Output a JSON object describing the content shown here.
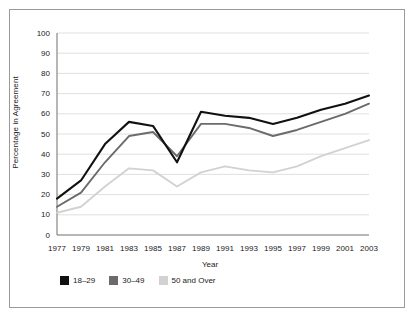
{
  "chart_data": {
    "type": "line",
    "title": "",
    "xlabel": "Year",
    "ylabel": "Percentage in Agreement",
    "x": [
      1977,
      1979,
      1981,
      1983,
      1985,
      1987,
      1989,
      1991,
      1993,
      1995,
      1997,
      1999,
      2001,
      2003
    ],
    "xtick_labels": [
      "1977",
      "1979",
      "1981",
      "1983",
      "1985",
      "1987",
      "1989",
      "1991",
      "1993",
      "1995",
      "1997",
      "1999",
      "2001",
      "2003"
    ],
    "ytick_labels": [
      "0",
      "10",
      "20",
      "30",
      "40",
      "50",
      "60",
      "70",
      "80",
      "90",
      "100"
    ],
    "yticks": [
      0,
      10,
      20,
      30,
      40,
      50,
      60,
      70,
      80,
      90,
      100
    ],
    "ylim": [
      0,
      100
    ],
    "xlim": [
      1977,
      2003
    ],
    "grid": "horizontal",
    "legend_position": "bottom-left",
    "series": [
      {
        "name": "18–29",
        "color": "#111111",
        "values": [
          18,
          27,
          45,
          56,
          54,
          36,
          61,
          59,
          58,
          55,
          58,
          62,
          65,
          69
        ]
      },
      {
        "name": "30–49",
        "color": "#6b6b6b",
        "values": [
          14,
          21,
          36,
          49,
          51,
          39,
          55,
          55,
          53,
          49,
          52,
          56,
          60,
          65
        ]
      },
      {
        "name": "50 and Over",
        "color": "#d2d2d2",
        "values": [
          11,
          14,
          24,
          33,
          32,
          24,
          31,
          34,
          32,
          31,
          34,
          39,
          43,
          47
        ]
      }
    ]
  },
  "legend": {
    "items": [
      {
        "label": "18–29",
        "color": "#111111"
      },
      {
        "label": "30–49",
        "color": "#6b6b6b"
      },
      {
        "label": "50 and Over",
        "color": "#d2d2d2"
      }
    ]
  },
  "axes": {
    "y_axis_title": "Percentage in Agreement",
    "x_axis_title": "Year"
  }
}
